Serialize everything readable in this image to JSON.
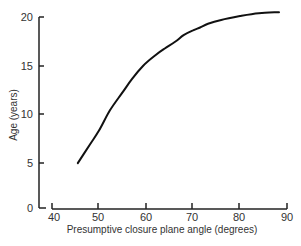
{
  "chart_data": {
    "type": "line",
    "title": "",
    "xlabel": "Presumptive closure plane angle (degrees)",
    "ylabel": "Age (years)",
    "xlim": [
      40,
      90
    ],
    "ylim": [
      0,
      20
    ],
    "xticks": [
      40,
      50,
      60,
      70,
      80,
      90
    ],
    "yticks": [
      0,
      5,
      10,
      15,
      20
    ],
    "grid": false,
    "legend": null,
    "series": [
      {
        "name": "Age vs closure plane angle",
        "x": [
          45.5,
          48,
          50,
          52.3,
          55,
          57,
          59.4,
          62,
          64,
          66.2,
          68,
          70,
          71.5,
          73.2,
          76,
          80,
          84,
          88.3
        ],
        "y": [
          4.7,
          6.6,
          8.1,
          10.2,
          12.1,
          13.5,
          14.9,
          16.0,
          16.7,
          17.4,
          18.1,
          18.6,
          18.9,
          19.3,
          19.7,
          20.1,
          20.4,
          20.5
        ]
      }
    ]
  }
}
